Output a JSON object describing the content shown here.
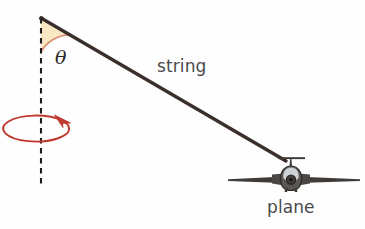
{
  "figure": {
    "type": "physics-diagram",
    "background_color": "#fefefe",
    "width": 365,
    "height": 229
  },
  "labels": {
    "string": "string",
    "plane": "plane",
    "theta": "θ"
  },
  "colors": {
    "string_line": "#3b2f2b",
    "angle_fill": "#fae7c3",
    "angle_arc": "#d98e72",
    "rotation_arrow": "#c0392f",
    "axis_dash": "#1c1c1c",
    "plane_body": "#4a4643",
    "plane_canopy": "#cfd2d4",
    "label_text": "#4a4a4c"
  },
  "geometry": {
    "pivot": {
      "x": 41,
      "y": 18
    },
    "plane_attach": {
      "x": 286,
      "y": 161
    },
    "dashed_axis": {
      "x": 41,
      "y_top": 18,
      "y_bottom": 186
    },
    "angle_wedge_radius": 34,
    "rotation_ellipse": {
      "cx": 41,
      "cy": 131,
      "rx": 33,
      "ry": 13
    },
    "wing_span": {
      "x_left": 228,
      "x_right": 360,
      "y": 180
    },
    "tail_crossbar": {
      "x_left": 278,
      "x_right": 305,
      "y": 158
    }
  },
  "cropped_text_above": {
    "fragment_left": "......",
    "fragment_right": "...."
  }
}
